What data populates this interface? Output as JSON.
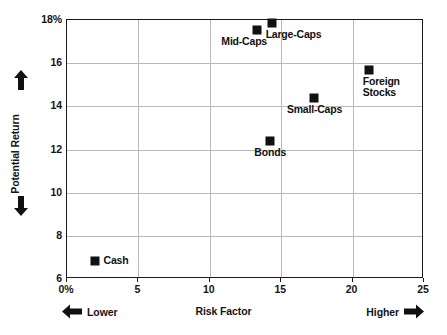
{
  "chart_data": {
    "type": "scatter",
    "title": "",
    "xlabel": "Risk Factor",
    "ylabel": "Potential Return",
    "xlim": [
      0,
      25
    ],
    "ylim": [
      6,
      18
    ],
    "grid": true,
    "legend": "none",
    "x_ticks": [
      {
        "value": 0,
        "label": "0%"
      },
      {
        "value": 5,
        "label": "5"
      },
      {
        "value": 10,
        "label": "10"
      },
      {
        "value": 15,
        "label": "15"
      },
      {
        "value": 20,
        "label": "20"
      },
      {
        "value": 25,
        "label": "25"
      }
    ],
    "y_ticks": [
      {
        "value": 6,
        "label": "6"
      },
      {
        "value": 8,
        "label": "8"
      },
      {
        "value": 10,
        "label": "10"
      },
      {
        "value": 12,
        "label": "12"
      },
      {
        "value": 14,
        "label": "14"
      },
      {
        "value": 16,
        "label": "16"
      },
      {
        "value": 18,
        "label": "18%"
      }
    ],
    "points": [
      {
        "name": "Cash",
        "label": "Cash",
        "x": 2.0,
        "y": 6.8,
        "label_pos": "right"
      },
      {
        "name": "Bonds",
        "label": "Bonds",
        "x": 14.3,
        "y": 12.35,
        "label_pos": "below"
      },
      {
        "name": "Mid-Caps",
        "label": "Mid-Caps",
        "x": 13.4,
        "y": 17.5,
        "label_pos": "below-left"
      },
      {
        "name": "Large-Caps",
        "label": "Large-Caps",
        "x": 14.4,
        "y": 17.8,
        "label_pos": "below-right"
      },
      {
        "name": "Small-Caps",
        "label": "Small-Caps",
        "x": 17.4,
        "y": 14.35,
        "label_pos": "below"
      },
      {
        "name": "Foreign Stocks",
        "label": "Foreign\nStocks",
        "x": 21.2,
        "y": 15.65,
        "label_pos": "below-right"
      }
    ],
    "marker_color": "#111111",
    "grid_color": "#b9b9b9",
    "axis_color": "#1a1a1a"
  },
  "annotations": {
    "y_axis_up_arrow": "arrow-up-icon",
    "y_axis_down_arrow": "arrow-down-icon",
    "x_axis_left_arrow": "arrow-left-icon",
    "x_axis_right_arrow": "arrow-right-icon",
    "lower_caption": "Lower",
    "higher_caption": "Higher"
  }
}
